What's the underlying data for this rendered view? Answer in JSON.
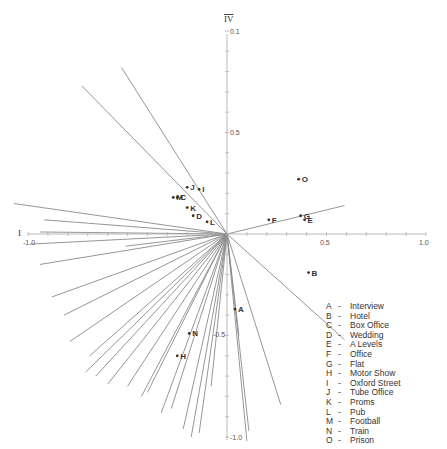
{
  "chart_data": {
    "type": "scatter",
    "title": "",
    "xlabel": "I",
    "ylabel": "IV",
    "xlim": [
      -1.0,
      1.0
    ],
    "ylim": [
      -1.0,
      1.0
    ],
    "grid": false,
    "legend_position": "bottom-right",
    "x_tick_labels": [
      "-1.0",
      "0.5",
      "1.0"
    ],
    "y_tick_labels": [
      "0.1",
      "0.5",
      "-0.5",
      "-1.0"
    ],
    "axis_label_x": "I",
    "axis_label_y": "IV",
    "points": [
      {
        "label": "A",
        "name": "Interview",
        "x": 0.04,
        "y": -0.37
      },
      {
        "label": "B",
        "name": "Hotel",
        "x": 0.41,
        "y": -0.19
      },
      {
        "label": "C",
        "name": "Box Office",
        "x": -0.25,
        "y": 0.18
      },
      {
        "label": "D",
        "name": "Wedding",
        "x": -0.17,
        "y": 0.09
      },
      {
        "label": "E",
        "name": "A Levels",
        "x": 0.39,
        "y": 0.07
      },
      {
        "label": "F",
        "name": "Office",
        "x": 0.21,
        "y": 0.07
      },
      {
        "label": "G",
        "name": "Flat",
        "x": 0.37,
        "y": 0.09
      },
      {
        "label": "H",
        "name": "Motor Show",
        "x": -0.25,
        "y": -0.6
      },
      {
        "label": "I",
        "name": "Oxford Street",
        "x": -0.14,
        "y": 0.22
      },
      {
        "label": "J",
        "name": "Tube Office",
        "x": -0.2,
        "y": 0.23
      },
      {
        "label": "K",
        "name": "Proms",
        "x": -0.2,
        "y": 0.13
      },
      {
        "label": "L",
        "name": "Pub",
        "x": -0.1,
        "y": 0.06
      },
      {
        "label": "M",
        "name": "Football",
        "x": -0.27,
        "y": 0.18
      },
      {
        "label": "N",
        "name": "Train",
        "x": -0.19,
        "y": -0.49
      },
      {
        "label": "O",
        "name": "Prison",
        "x": 0.36,
        "y": 0.27
      }
    ],
    "vectors": [
      {
        "x": -0.53,
        "y": 0.82
      },
      {
        "x": -0.73,
        "y": 0.73
      },
      {
        "x": 0.59,
        "y": 0.14
      },
      {
        "x": 0.59,
        "y": -0.52
      },
      {
        "x": -0.92,
        "y": 0.07
      },
      {
        "x": -1.07,
        "y": 0.15
      },
      {
        "x": -0.94,
        "y": 0.01
      },
      {
        "x": -0.51,
        "y": -0.06
      },
      {
        "x": -0.94,
        "y": -0.15
      },
      {
        "x": -0.99,
        "y": -0.05
      },
      {
        "x": -0.88,
        "y": -0.31
      },
      {
        "x": -0.82,
        "y": -0.4
      },
      {
        "x": -0.79,
        "y": -0.53
      },
      {
        "x": -0.69,
        "y": -0.6
      },
      {
        "x": -0.71,
        "y": -0.68
      },
      {
        "x": -0.66,
        "y": -0.7
      },
      {
        "x": -0.6,
        "y": -0.74
      },
      {
        "x": -0.5,
        "y": -0.75
      },
      {
        "x": -0.43,
        "y": -0.8
      },
      {
        "x": -0.4,
        "y": -0.78
      },
      {
        "x": -0.33,
        "y": -0.88
      },
      {
        "x": -0.28,
        "y": -0.86
      },
      {
        "x": -0.22,
        "y": -0.96
      },
      {
        "x": -0.18,
        "y": -1.0
      },
      {
        "x": -0.14,
        "y": -0.98
      },
      {
        "x": -0.08,
        "y": -0.75
      },
      {
        "x": 0.1,
        "y": -1.02
      },
      {
        "x": 0.11,
        "y": -0.97
      },
      {
        "x": 0.27,
        "y": -0.84
      },
      {
        "x": 0.06,
        "y": -0.5
      }
    ]
  },
  "axes": {
    "x_label_left": "I",
    "y_label_top": "IV",
    "tick_labels": {
      "x_neg": "-1.0",
      "x_half": "0.5",
      "x_pos": "1.0",
      "y_top": "0.1",
      "y_half": "0.5",
      "y_neg_half": "-0.5",
      "y_neg": "-1.0"
    }
  },
  "legend": {
    "items": [
      {
        "key": "A",
        "label": "Interview"
      },
      {
        "key": "B",
        "label": "Hotel"
      },
      {
        "key": "C",
        "label": "Box Office"
      },
      {
        "key": "D",
        "label": "Wedding"
      },
      {
        "key": "E",
        "label": "A Levels"
      },
      {
        "key": "F",
        "label": "Office"
      },
      {
        "key": "G",
        "label": "Flat"
      },
      {
        "key": "H",
        "label": "Motor Show"
      },
      {
        "key": "I",
        "label": "Oxford Street"
      },
      {
        "key": "J",
        "label": "Tube Office"
      },
      {
        "key": "K",
        "label": "Proms"
      },
      {
        "key": "L",
        "label": "Pub"
      },
      {
        "key": "M",
        "label": "Football"
      },
      {
        "key": "N",
        "label": "Train"
      },
      {
        "key": "O",
        "label": "Prison"
      }
    ],
    "separator": "-"
  },
  "colors": {
    "axis": "#999999",
    "vector": "#8a8a8a",
    "point": "#333333",
    "text": "#333333"
  }
}
